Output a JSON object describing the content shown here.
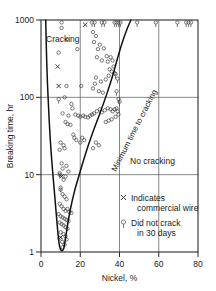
{
  "chart_data": {
    "type": "scatter",
    "title": "",
    "xlabel": "Nickel, %",
    "ylabel": "Breaking time, hr",
    "xlim": [
      0,
      80
    ],
    "ylim": [
      1,
      1000
    ],
    "yscale": "log",
    "xticks": [
      0,
      20,
      40,
      60,
      80
    ],
    "xticklabels": [
      "0",
      "20",
      "40",
      "60",
      "80"
    ],
    "yticks": [
      1,
      10,
      100,
      1000
    ],
    "yticklabels": [
      "1",
      "10",
      "100",
      "1000"
    ],
    "grid": "both",
    "legend_position": "inside-lower-right",
    "annotations": [
      {
        "text": "Cracking",
        "x": 4,
        "y": 620
      },
      {
        "text": "No cracking",
        "x": 44,
        "y": 14
      },
      {
        "text": "Minimum time to cracking",
        "x": 34,
        "y": 22,
        "rotated": true
      }
    ],
    "legend": [
      {
        "marker": "x",
        "label_line1": "Indicates",
        "label_line2": "commercial wire"
      },
      {
        "marker": "circle-tail",
        "label_line1": "Did not crack",
        "label_line2": "in 30 days"
      }
    ],
    "series": [
      {
        "name": "Cracked specimens",
        "marker": "open-circle",
        "points": [
          [
            10.5,
            930
          ],
          [
            10.5,
            790
          ],
          [
            13.2,
            560
          ],
          [
            18.5,
            420
          ],
          [
            9.0,
            380
          ],
          [
            26.5,
            700
          ],
          [
            28.0,
            620
          ],
          [
            27.0,
            520
          ],
          [
            30.0,
            480
          ],
          [
            29.0,
            420
          ],
          [
            32.0,
            430
          ],
          [
            33.5,
            340
          ],
          [
            28.5,
            330
          ],
          [
            31.0,
            300
          ],
          [
            34.0,
            290
          ],
          [
            35.5,
            330
          ],
          [
            36.5,
            300
          ],
          [
            37.0,
            250
          ],
          [
            35.0,
            230
          ],
          [
            36.0,
            215
          ],
          [
            37.5,
            205
          ],
          [
            34.5,
            190
          ],
          [
            33.0,
            170
          ],
          [
            30.5,
            160
          ],
          [
            28.0,
            180
          ],
          [
            27.5,
            150
          ],
          [
            26.5,
            130
          ],
          [
            29.5,
            120
          ],
          [
            31.5,
            115
          ],
          [
            13.0,
            140
          ],
          [
            20.5,
            140
          ],
          [
            12.0,
            100
          ],
          [
            15.5,
            82
          ],
          [
            16.0,
            72
          ],
          [
            11.0,
            62
          ],
          [
            14.0,
            58
          ],
          [
            12.5,
            48
          ],
          [
            13.5,
            45
          ],
          [
            15.0,
            44
          ],
          [
            17.5,
            60
          ],
          [
            19.0,
            58
          ],
          [
            20.0,
            56
          ],
          [
            21.5,
            58
          ],
          [
            22.5,
            56
          ],
          [
            24.0,
            55
          ],
          [
            25.0,
            58
          ],
          [
            26.0,
            60
          ],
          [
            27.0,
            62
          ],
          [
            28.5,
            66
          ],
          [
            30.0,
            70
          ],
          [
            31.0,
            64
          ],
          [
            32.5,
            68
          ],
          [
            34.0,
            72
          ],
          [
            35.5,
            70
          ],
          [
            36.5,
            66
          ],
          [
            37.5,
            70
          ],
          [
            38.5,
            72
          ],
          [
            39.0,
            66
          ],
          [
            39.5,
            60
          ],
          [
            38.0,
            56
          ],
          [
            36.0,
            52
          ],
          [
            34.5,
            50
          ],
          [
            33.0,
            48
          ],
          [
            16.5,
            33
          ],
          [
            17.0,
            30
          ],
          [
            18.0,
            28
          ],
          [
            20.0,
            26
          ],
          [
            21.0,
            30
          ],
          [
            22.0,
            28
          ],
          [
            28.0,
            26
          ],
          [
            29.5,
            24
          ],
          [
            26.5,
            22
          ],
          [
            10.0,
            26
          ],
          [
            11.5,
            24
          ],
          [
            12.0,
            22
          ],
          [
            9.5,
            21
          ],
          [
            10.5,
            14
          ],
          [
            11.0,
            12
          ],
          [
            13.0,
            13
          ],
          [
            14.0,
            11
          ],
          [
            9.5,
            10
          ],
          [
            12.5,
            9.5
          ],
          [
            11.5,
            8.6
          ],
          [
            10.0,
            6.4
          ],
          [
            11.0,
            5.6
          ],
          [
            12.0,
            5.2
          ],
          [
            13.0,
            4.8
          ],
          [
            9.5,
            4.2
          ],
          [
            10.5,
            3.9
          ],
          [
            11.5,
            3.6
          ],
          [
            12.5,
            3.4
          ],
          [
            13.5,
            3.6
          ],
          [
            14.5,
            3.3
          ],
          [
            15.5,
            3.2
          ],
          [
            9.0,
            3.1
          ],
          [
            10.0,
            2.9
          ],
          [
            11.0,
            2.8
          ],
          [
            12.0,
            2.7
          ],
          [
            13.0,
            2.6
          ],
          [
            14.0,
            2.5
          ],
          [
            9.5,
            2.4
          ],
          [
            10.5,
            2.3
          ],
          [
            11.5,
            2.2
          ],
          [
            12.5,
            2.1
          ],
          [
            13.5,
            2.0
          ],
          [
            10.0,
            1.8
          ],
          [
            11.5,
            1.7
          ],
          [
            12.5,
            1.6
          ],
          [
            9.5,
            1.5
          ],
          [
            13.0,
            1.45
          ],
          [
            10.8,
            1.35
          ],
          [
            12.0,
            1.25
          ],
          [
            11.0,
            1.15
          ]
        ]
      },
      {
        "name": "Commercial wire",
        "marker": "x",
        "points": [
          [
            22.5,
            870
          ],
          [
            8.5,
            250
          ],
          [
            9.0,
            140
          ],
          [
            10.5,
            9.5
          ],
          [
            10.0,
            1.55
          ]
        ]
      },
      {
        "name": "Did not crack in 30 days",
        "marker": "circle-tail",
        "points": [
          [
            26.0,
            930
          ],
          [
            27.3,
            930
          ],
          [
            31.0,
            930
          ],
          [
            32.3,
            930
          ],
          [
            37.5,
            930
          ],
          [
            38.5,
            930
          ],
          [
            39.5,
            930
          ],
          [
            40.5,
            930
          ],
          [
            49.0,
            930
          ],
          [
            58.5,
            930
          ],
          [
            69.5,
            930
          ],
          [
            74.0,
            930
          ],
          [
            75.2,
            930
          ],
          [
            76.4,
            930
          ],
          [
            38.0,
            200
          ],
          [
            39.0,
            175
          ],
          [
            38.5,
            120
          ],
          [
            39.5,
            95
          ],
          [
            40.0,
            88
          ],
          [
            9.0,
            95
          ],
          [
            9.5,
            10.5
          ],
          [
            10.0,
            6.8
          ]
        ]
      }
    ],
    "boundary_curve": {
      "name": "Minimum time to cracking",
      "left_branch": [
        [
          2.4,
          1000
        ],
        [
          2.6,
          600
        ],
        [
          2.9,
          300
        ],
        [
          3.3,
          150
        ],
        [
          3.9,
          70
        ],
        [
          4.6,
          32
        ],
        [
          5.5,
          15
        ],
        [
          6.6,
          7
        ],
        [
          7.6,
          3.5
        ],
        [
          8.5,
          1.9
        ],
        [
          9.3,
          1.25
        ]
      ],
      "right_branch": [
        [
          9.3,
          1.25
        ],
        [
          10.3,
          1.05
        ],
        [
          11.5,
          1.1
        ],
        [
          12.5,
          1.5
        ],
        [
          13.5,
          2.2
        ],
        [
          15.0,
          3.6
        ],
        [
          17.0,
          6.0
        ],
        [
          19.5,
          10
        ],
        [
          22.5,
          18
        ],
        [
          26.0,
          33
        ],
        [
          30.0,
          62
        ],
        [
          33.5,
          110
        ],
        [
          36.5,
          190
        ],
        [
          39.0,
          320
        ],
        [
          41.5,
          520
        ],
        [
          44.0,
          780
        ],
        [
          45.8,
          1000
        ]
      ]
    }
  }
}
